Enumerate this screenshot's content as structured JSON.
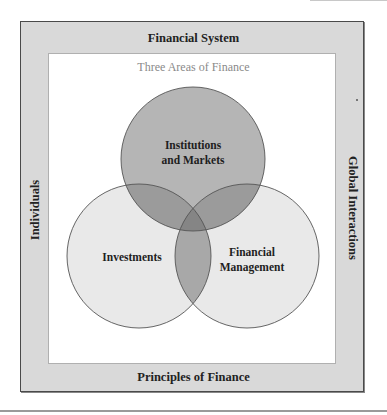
{
  "diagram": {
    "frame": {
      "top_label": "Financial System",
      "bottom_label": "Principles of Finance",
      "left_label": "Individuals",
      "right_label": "Global Interactions"
    },
    "subtitle": "Three Areas of Finance",
    "circles": [
      {
        "id": "institutions",
        "line1": "Institutions",
        "line2": "and Markets",
        "cx": 193,
        "cy": 159,
        "r": 72,
        "fill": "#b3b3b3"
      },
      {
        "id": "investments",
        "line1": "Investments",
        "line2": "",
        "cx": 139,
        "cy": 256,
        "r": 72,
        "fill": "#e9e9e9"
      },
      {
        "id": "financial-management",
        "line1": "Financial",
        "line2": "Management",
        "cx": 247,
        "cy": 256,
        "r": 72,
        "fill": "#e9e9e9"
      }
    ],
    "colors": {
      "frame_fill": "#d9d9d9",
      "frame_border": "#4a4a4a",
      "inner_fill": "#ffffff",
      "subtitle": "#8a8a8a",
      "circle_stroke": "#555555"
    }
  }
}
